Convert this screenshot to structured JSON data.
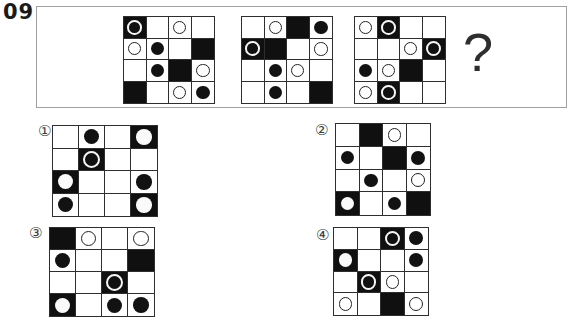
{
  "page": {
    "number": "09"
  },
  "question_box": {
    "question_mark": "?",
    "grids": [
      {
        "cells": [
          [
            "kr",
            "w",
            "wo",
            "w"
          ],
          [
            "wo",
            "wb",
            "w",
            "k"
          ],
          [
            "w",
            "wb",
            "k",
            "wo"
          ],
          [
            "k",
            "w",
            "wo",
            "wb"
          ]
        ]
      },
      {
        "cells": [
          [
            "w",
            "wo",
            "k",
            "wb"
          ],
          [
            "kr",
            "k",
            "w",
            "wo"
          ],
          [
            "w",
            "wb",
            "wo",
            "w"
          ],
          [
            "w",
            "wb",
            "w",
            "k"
          ]
        ]
      },
      {
        "cells": [
          [
            "wo",
            "kr",
            "w",
            "w"
          ],
          [
            "w",
            "w",
            "wo",
            "kr"
          ],
          [
            "wb",
            "wo",
            "k",
            "w"
          ],
          [
            "wo",
            "kr",
            "w",
            "w"
          ]
        ]
      }
    ]
  },
  "options": [
    {
      "label": "①",
      "cells": [
        [
          "w",
          "wb",
          "w",
          "kw"
        ],
        [
          "w",
          "kr",
          "w",
          "w"
        ],
        [
          "kw",
          "w",
          "w",
          "wb"
        ],
        [
          "wb",
          "w",
          "w",
          "kw"
        ]
      ]
    },
    {
      "label": "②",
      "cells": [
        [
          "w",
          "k",
          "wo",
          "w"
        ],
        [
          "wb",
          "w",
          "k",
          "wb"
        ],
        [
          "w",
          "wb",
          "w",
          "wo"
        ],
        [
          "kw",
          "w",
          "wb",
          "k"
        ]
      ]
    },
    {
      "label": "③",
      "cells": [
        [
          "k",
          "wo",
          "w",
          "wo"
        ],
        [
          "wb",
          "w",
          "w",
          "k"
        ],
        [
          "w",
          "w",
          "kr",
          "w"
        ],
        [
          "kw",
          "w",
          "wb",
          "wb"
        ]
      ]
    },
    {
      "label": "④",
      "cells": [
        [
          "w",
          "w",
          "kr",
          "wb"
        ],
        [
          "kw",
          "w",
          "w",
          "wb"
        ],
        [
          "w",
          "kr",
          "wo",
          "w"
        ],
        [
          "wo",
          "w",
          "k",
          "wo"
        ]
      ]
    }
  ],
  "cell_legend": {
    "w": "white-empty-cell",
    "k": "black-cell",
    "wo": "white-cell-outline-circle",
    "wb": "white-cell-black-dot",
    "kr": "black-cell-white-ring",
    "kw": "black-cell-white-dot"
  },
  "colors": {
    "background": "#ffffff",
    "cell_black": "#101010",
    "grid_line": "#2e2e2e",
    "box_border": "#a0a0a0",
    "text": "#1a1a1a"
  }
}
